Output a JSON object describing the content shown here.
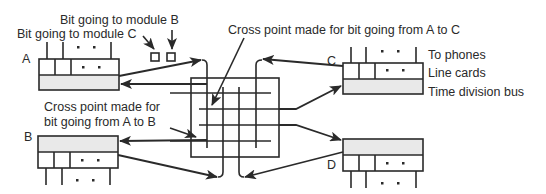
{
  "diagram": {
    "type": "time-division switch with cross-point matrix",
    "modules": [
      {
        "id": "A",
        "label": "A"
      },
      {
        "id": "B",
        "label": "B"
      },
      {
        "id": "C",
        "label": "C"
      },
      {
        "id": "D",
        "label": "D"
      }
    ],
    "annotations": {
      "bit_to_b": "Bit going to module B",
      "bit_to_c": "Bit going to module C",
      "cross_a_to_c": "Cross point made for bit going from A to C",
      "cross_a_to_b_line1": "Cross point made for",
      "cross_a_to_b_line2": "bit going from A to B",
      "to_phones": "To phones",
      "line_cards": "Line cards",
      "time_division_bus": "Time division bus"
    },
    "colors": {
      "ink": "#2a2a2a",
      "bus_fill": "#e9e9e9",
      "background": "#ffffff"
    }
  }
}
